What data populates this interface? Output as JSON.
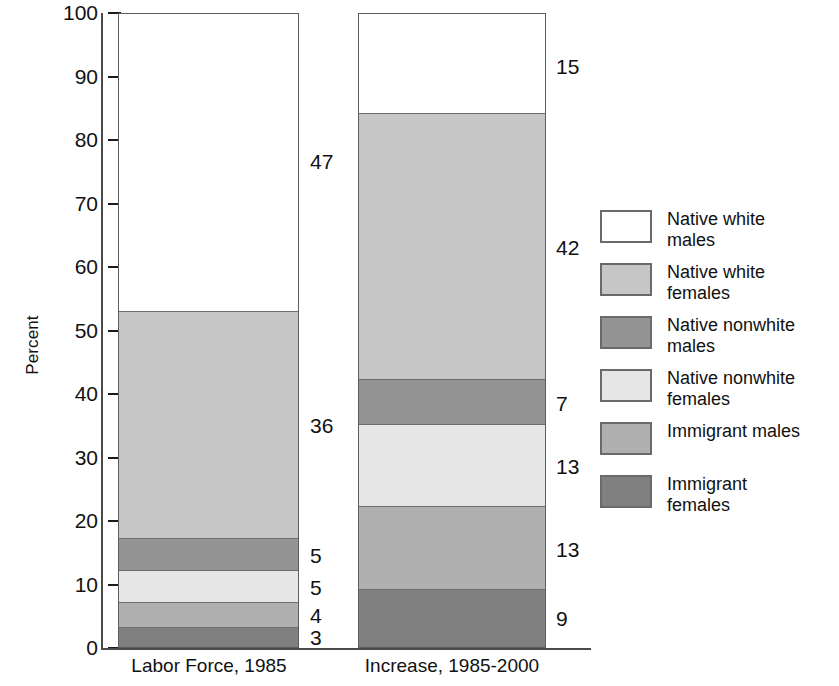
{
  "chart_data": {
    "type": "bar",
    "subtype": "stacked-percent",
    "title": "",
    "xlabel": "",
    "ylabel": "Percent",
    "ylim": [
      0,
      100
    ],
    "yticks": [
      0,
      10,
      20,
      30,
      40,
      50,
      60,
      70,
      80,
      90,
      100
    ],
    "ytick_labels": [
      "0",
      "10",
      "20",
      "30",
      "40",
      "50",
      "60",
      "70",
      "80",
      "90",
      "100"
    ],
    "grid": false,
    "legend_position": "right",
    "categories": [
      "Labor Force, 1985",
      "Increase, 1985-2000"
    ],
    "series": [
      {
        "name": "Native white males",
        "key": "nwm",
        "color": "#ffffff",
        "values": [
          47,
          15
        ]
      },
      {
        "name": "Native white females",
        "key": "nwf",
        "color": "#c6c6c6",
        "values": [
          36,
          42
        ]
      },
      {
        "name": "Native nonwhite males",
        "key": "nnm",
        "color": "#949494",
        "values": [
          5,
          7
        ]
      },
      {
        "name": "Native nonwhite females",
        "key": "nnf",
        "color": "#e6e6e6",
        "values": [
          5,
          13
        ]
      },
      {
        "name": "Immigrant males",
        "key": "im",
        "color": "#b0b0b0",
        "values": [
          4,
          13
        ]
      },
      {
        "name": "Immigrant females",
        "key": "if",
        "color": "#808080",
        "values": [
          3,
          9
        ]
      }
    ],
    "stack_order_bottom_to_top": [
      "Immigrant females",
      "Immigrant males",
      "Native nonwhite females",
      "Native nonwhite males",
      "Native white females",
      "Native white males"
    ],
    "data_labels": {
      "Labor Force, 1985": [
        "3",
        "4",
        "5",
        "5",
        "36",
        "47"
      ],
      "Increase, 1985-2000": [
        "9",
        "13",
        "13",
        "7",
        "42",
        "15"
      ]
    }
  },
  "axis": {
    "y_title": "Percent",
    "ticks": [
      "100",
      "90",
      "80",
      "70",
      "60",
      "50",
      "40",
      "30",
      "20",
      "10",
      "0"
    ]
  },
  "bars": [
    {
      "label": "Labor Force, 1985",
      "segments": [
        {
          "name": "Immigrant females",
          "value": "3",
          "fill": "fill-if"
        },
        {
          "name": "Immigrant males",
          "value": "4",
          "fill": "fill-im"
        },
        {
          "name": "Native nonwhite females",
          "value": "5",
          "fill": "fill-nnf"
        },
        {
          "name": "Native nonwhite males",
          "value": "5",
          "fill": "fill-nnm"
        },
        {
          "name": "Native white females",
          "value": "36",
          "fill": "fill-nwf"
        },
        {
          "name": "Native white males",
          "value": "47",
          "fill": "fill-nwm"
        }
      ]
    },
    {
      "label": "Increase, 1985-2000",
      "segments": [
        {
          "name": "Immigrant females",
          "value": "9",
          "fill": "fill-if"
        },
        {
          "name": "Immigrant males",
          "value": "13",
          "fill": "fill-im"
        },
        {
          "name": "Native nonwhite females",
          "value": "13",
          "fill": "fill-nnf"
        },
        {
          "name": "Native nonwhite males",
          "value": "7",
          "fill": "fill-nnm"
        },
        {
          "name": "Native white females",
          "value": "42",
          "fill": "fill-nwf"
        },
        {
          "name": "Native white males",
          "value": "15",
          "fill": "fill-nwm"
        }
      ]
    }
  ],
  "legend": {
    "items": [
      {
        "line1": "Native white",
        "line2": "males",
        "fill": "fill-nwm"
      },
      {
        "line1": "Native white",
        "line2": "females",
        "fill": "fill-nwf"
      },
      {
        "line1": "Native nonwhite",
        "line2": "males",
        "fill": "fill-nnm"
      },
      {
        "line1": "Native nonwhite",
        "line2": "females",
        "fill": "fill-nnf"
      },
      {
        "line1": "Immigrant males",
        "line2": "",
        "fill": "fill-im"
      },
      {
        "line1": "Immigrant",
        "line2": "females",
        "fill": "fill-if"
      }
    ]
  }
}
